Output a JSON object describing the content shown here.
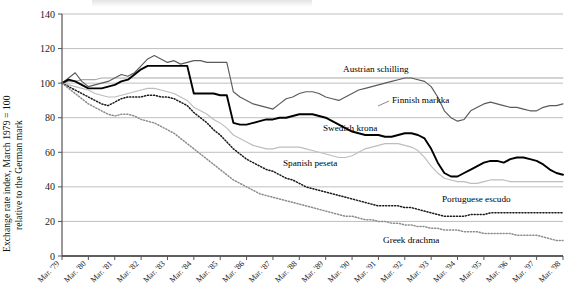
{
  "axis": {
    "ylabel_line1": "Exchange rate index, March 1979 = 100",
    "ylabel_line2": "relative to the German mark",
    "yticks": [
      "0",
      "20",
      "40",
      "60",
      "80",
      "100",
      "120",
      "140"
    ],
    "xticks": [
      "Mar. '79",
      "Mar. '80",
      "Mar. '81",
      "Mar. '82",
      "Mar. '83",
      "Mar. '84",
      "Mar. '85",
      "Mar. '86",
      "Mar. '87",
      "Mar. '88",
      "Mar. '89",
      "Mar. '90",
      "Mar. '91",
      "Mar. '92",
      "Mar. '93",
      "Mar. '94",
      "Mar. '95",
      "Mar. '96",
      "Mar. '97",
      "Mar. '98"
    ]
  },
  "labels": {
    "austrian": "Austrian schilling",
    "finnish": "Finnish markka",
    "swedish": "Swedish krona",
    "spanish": "Spanish peseta",
    "portuguese": "Portuguese escudo",
    "greek": "Greek drachma"
  },
  "colors": {
    "austrian": "#a8a8a8",
    "finnish": "#5a5a5a",
    "swedish": "#000000",
    "spanish": "#bdbdbd",
    "portuguese": "#1a1a1a",
    "greek": "#8c8c8c",
    "grid": "#bfbfbf",
    "axis": "#555555"
  },
  "chart_data": {
    "type": "line",
    "title": "",
    "xlabel": "",
    "ylabel": "Exchange rate index, March 1979 = 100 relative to the German mark",
    "ylim": [
      0,
      140
    ],
    "ytick_step": 20,
    "grid": true,
    "legend": "inline-annotations",
    "x_start": "Mar. '79",
    "x_end": "Mar. '98",
    "x_unit": "quarter",
    "n_points": 77,
    "series": [
      {
        "name": "Austrian schilling",
        "color": "#a8a8a8",
        "style": "solid",
        "values": [
          100,
          101,
          101,
          102,
          102,
          102,
          103,
          103,
          103,
          103,
          103,
          103,
          103,
          103,
          103,
          103,
          103,
          103,
          103,
          103,
          103,
          103,
          103,
          103,
          103,
          103,
          103,
          103,
          103,
          103,
          103,
          103,
          103,
          103,
          103,
          103,
          103,
          103,
          103,
          103,
          103,
          103,
          103,
          103,
          103,
          103,
          103,
          103,
          103,
          103,
          103,
          103,
          103,
          103,
          103,
          103,
          103,
          103,
          103,
          103,
          103,
          103,
          103,
          103,
          103,
          103,
          103,
          103,
          103,
          103,
          103,
          103,
          103,
          103,
          103,
          103,
          103
        ]
      },
      {
        "name": "Finnish markka",
        "color": "#5a5a5a",
        "style": "solid",
        "values": [
          100,
          103,
          106,
          101,
          98,
          99,
          100,
          101,
          103,
          105,
          104,
          106,
          110,
          114,
          116,
          114,
          112,
          113,
          111,
          112,
          113,
          113,
          112,
          112,
          112,
          112,
          95,
          92,
          90,
          88,
          87,
          86,
          85,
          88,
          91,
          92,
          94,
          95,
          95,
          94,
          92,
          91,
          90,
          92,
          94,
          96,
          97,
          98,
          99,
          100,
          101,
          102,
          103,
          103,
          102,
          101,
          98,
          92,
          84,
          80,
          78,
          79,
          84,
          86,
          88,
          89,
          88,
          87,
          86,
          86,
          85,
          84,
          84,
          86,
          87,
          87,
          88
        ]
      },
      {
        "name": "Swedish krona",
        "color": "#000000",
        "style": "solid",
        "values": [
          100,
          102,
          101,
          99,
          97,
          97,
          97,
          98,
          99,
          101,
          102,
          105,
          108,
          110,
          110,
          110,
          110,
          110,
          110,
          110,
          94,
          94,
          94,
          94,
          93,
          93,
          77,
          76,
          76,
          77,
          78,
          79,
          79,
          80,
          80,
          81,
          82,
          82,
          82,
          81,
          80,
          78,
          76,
          74,
          72,
          71,
          70,
          70,
          70,
          69,
          69,
          70,
          71,
          71,
          70,
          68,
          62,
          54,
          48,
          46,
          46,
          48,
          50,
          52,
          54,
          55,
          55,
          54,
          56,
          57,
          57,
          56,
          55,
          53,
          50,
          48,
          47
        ]
      },
      {
        "name": "Spanish peseta",
        "color": "#bdbdbd",
        "style": "solid",
        "values": [
          100,
          99,
          98,
          97,
          96,
          94,
          93,
          92,
          92,
          93,
          94,
          95,
          96,
          97,
          97,
          96,
          95,
          94,
          92,
          90,
          86,
          84,
          82,
          79,
          77,
          74,
          70,
          68,
          66,
          64,
          63,
          62,
          62,
          63,
          63,
          63,
          63,
          62,
          61,
          60,
          59,
          58,
          57,
          57,
          58,
          60,
          62,
          63,
          64,
          65,
          65,
          65,
          64,
          63,
          61,
          57,
          52,
          48,
          45,
          44,
          43,
          43,
          42,
          42,
          43,
          44,
          44,
          44,
          43,
          43,
          43,
          43,
          43,
          43,
          43,
          43,
          43
        ]
      },
      {
        "name": "Portuguese escudo",
        "color": "#1a1a1a",
        "style": "dotted",
        "values": [
          100,
          98,
          96,
          94,
          92,
          90,
          88,
          87,
          89,
          91,
          92,
          92,
          92,
          93,
          93,
          92,
          92,
          91,
          89,
          87,
          83,
          80,
          77,
          73,
          70,
          66,
          62,
          59,
          56,
          54,
          52,
          50,
          49,
          47,
          45,
          44,
          42,
          40,
          39,
          38,
          37,
          36,
          35,
          34,
          33,
          32,
          31,
          30,
          29,
          29,
          29,
          29,
          28,
          28,
          27,
          26,
          25,
          24,
          23,
          23,
          23,
          23,
          24,
          24,
          24,
          25,
          25,
          25,
          25,
          25,
          25,
          25,
          25,
          25,
          25,
          25,
          25
        ]
      },
      {
        "name": "Greek drachma",
        "color": "#8c8c8c",
        "style": "dotted",
        "values": [
          100,
          97,
          94,
          91,
          88,
          86,
          84,
          82,
          81,
          82,
          82,
          81,
          79,
          78,
          77,
          75,
          73,
          71,
          68,
          65,
          62,
          59,
          56,
          53,
          50,
          47,
          44,
          42,
          40,
          38,
          36,
          35,
          34,
          33,
          32,
          31,
          30,
          29,
          28,
          27,
          26,
          25,
          24,
          23,
          23,
          22,
          21,
          21,
          20,
          20,
          19,
          19,
          18,
          18,
          17,
          17,
          16,
          16,
          15,
          15,
          15,
          14,
          14,
          14,
          13,
          13,
          13,
          13,
          13,
          12,
          12,
          12,
          12,
          11,
          10,
          9,
          9
        ]
      }
    ]
  }
}
